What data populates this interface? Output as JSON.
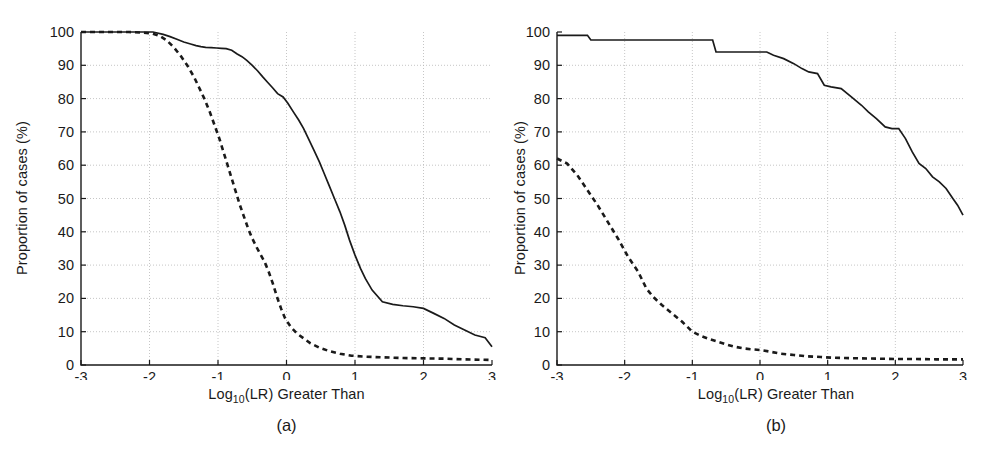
{
  "figure": {
    "background": "#ffffff",
    "ink_color": "#1a1a1a",
    "grid_color": "#b8b8b8"
  },
  "chart_data": [
    {
      "id": "panel-a",
      "type": "line",
      "title": "",
      "caption": "(a)",
      "xlabel": "Log10(LR) Greater Than",
      "xlabel_base": "Log",
      "xlabel_sub": "10",
      "xlabel_rest": "(LR) Greater Than",
      "ylabel": "Proportion of cases (%)",
      "xlim": [
        -3,
        3
      ],
      "ylim": [
        0,
        100
      ],
      "xticks": [
        -3,
        -2,
        -1,
        0,
        1,
        2,
        3
      ],
      "xtick_labels": [
        "-3",
        "-2",
        "-1",
        "0",
        "1",
        "2",
        "3"
      ],
      "yticks": [
        0,
        10,
        20,
        30,
        40,
        50,
        60,
        70,
        80,
        90,
        100
      ],
      "ytick_labels": [
        "0",
        "10",
        "20",
        "30",
        "40",
        "50",
        "60",
        "70",
        "80",
        "90",
        "100"
      ],
      "grid": true,
      "legend": "none",
      "series": [
        {
          "name": "solid-curve",
          "style": "solid",
          "x": [
            -3.0,
            -2.6,
            -2.2,
            -1.95,
            -1.8,
            -1.7,
            -1.6,
            -1.5,
            -1.4,
            -1.32,
            -1.25,
            -1.18,
            -1.1,
            -1.02,
            -0.95,
            -0.88,
            -0.8,
            -0.72,
            -0.65,
            -0.58,
            -0.5,
            -0.42,
            -0.35,
            -0.28,
            -0.2,
            -0.13,
            -0.05,
            0.02,
            0.1,
            0.18,
            0.25,
            0.32,
            0.4,
            0.48,
            0.55,
            0.62,
            0.7,
            0.78,
            0.85,
            0.92,
            1.0,
            1.08,
            1.15,
            1.25,
            1.4,
            1.55,
            1.7,
            1.85,
            2.0,
            2.15,
            2.3,
            2.45,
            2.6,
            2.75,
            2.9,
            3.0
          ],
          "y": [
            100.0,
            100.0,
            100.0,
            100.0,
            99.3,
            98.6,
            97.8,
            97.0,
            96.4,
            95.9,
            95.6,
            95.4,
            95.3,
            95.2,
            95.1,
            95.0,
            94.5,
            93.4,
            92.6,
            91.5,
            90.0,
            88.3,
            86.6,
            85.0,
            83.2,
            81.5,
            80.5,
            78.6,
            76.0,
            73.5,
            71.0,
            68.0,
            64.5,
            61.0,
            57.5,
            54.0,
            50.0,
            46.0,
            42.0,
            37.5,
            33.0,
            29.0,
            26.0,
            22.5,
            19.0,
            18.2,
            17.8,
            17.5,
            17.0,
            15.5,
            14.0,
            12.0,
            10.5,
            9.0,
            8.2,
            5.5
          ]
        },
        {
          "name": "dashed-curve",
          "style": "dashed",
          "x": [
            -3.0,
            -2.6,
            -2.3,
            -2.1,
            -1.95,
            -1.85,
            -1.75,
            -1.65,
            -1.55,
            -1.45,
            -1.35,
            -1.28,
            -1.2,
            -1.12,
            -1.05,
            -0.98,
            -0.92,
            -0.86,
            -0.8,
            -0.74,
            -0.68,
            -0.62,
            -0.56,
            -0.5,
            -0.44,
            -0.38,
            -0.32,
            -0.26,
            -0.2,
            -0.14,
            -0.08,
            -0.02,
            0.06,
            0.15,
            0.25,
            0.35,
            0.48,
            0.62,
            0.78,
            0.95,
            1.15,
            1.4,
            1.7,
            2.0,
            2.3,
            2.6,
            3.0
          ],
          "y": [
            100.0,
            100.0,
            100.0,
            99.8,
            99.5,
            98.8,
            97.5,
            95.5,
            93.0,
            90.0,
            86.5,
            83.5,
            80.0,
            76.0,
            72.0,
            68.0,
            64.0,
            60.0,
            56.0,
            52.0,
            48.0,
            44.5,
            41.0,
            38.0,
            35.5,
            33.2,
            31.0,
            28.0,
            24.5,
            20.5,
            17.0,
            14.0,
            11.5,
            9.5,
            8.0,
            6.5,
            5.2,
            4.2,
            3.4,
            2.8,
            2.5,
            2.3,
            2.1,
            2.0,
            1.9,
            1.7,
            1.5
          ]
        }
      ]
    },
    {
      "id": "panel-b",
      "type": "line",
      "title": "",
      "caption": "(b)",
      "xlabel": "Log10(LR) Greater Than",
      "xlabel_base": "Log",
      "xlabel_sub": "10",
      "xlabel_rest": "(LR) Greater Than",
      "ylabel": "Proportion of cases (%)",
      "xlim": [
        -3,
        3
      ],
      "ylim": [
        0,
        100
      ],
      "xticks": [
        -3,
        -2,
        -1,
        0,
        1,
        2,
        3
      ],
      "xtick_labels": [
        "-3",
        "-2",
        "-1",
        "0",
        "1",
        "2",
        "3"
      ],
      "yticks": [
        0,
        10,
        20,
        30,
        40,
        50,
        60,
        70,
        80,
        90,
        100
      ],
      "ytick_labels": [
        "0",
        "10",
        "20",
        "30",
        "40",
        "50",
        "60",
        "70",
        "80",
        "90",
        "100"
      ],
      "grid": true,
      "legend": "none",
      "series": [
        {
          "name": "solid-curve",
          "style": "solid",
          "x": [
            -3.0,
            -2.55,
            -2.5,
            -1.5,
            -0.7,
            -0.65,
            0.1,
            0.2,
            0.35,
            0.5,
            0.62,
            0.72,
            0.85,
            0.95,
            1.05,
            1.2,
            1.35,
            1.5,
            1.6,
            1.72,
            1.85,
            1.95,
            2.05,
            2.15,
            2.25,
            2.35,
            2.45,
            2.55,
            2.65,
            2.75,
            2.85,
            2.92,
            3.0
          ],
          "y": [
            99.0,
            99.0,
            97.6,
            97.6,
            97.6,
            94.0,
            94.0,
            93.0,
            92.0,
            90.5,
            89.0,
            88.0,
            87.5,
            84.0,
            83.5,
            83.0,
            80.5,
            78.0,
            76.0,
            74.0,
            71.5,
            71.0,
            71.0,
            68.0,
            64.0,
            60.5,
            59.0,
            56.5,
            55.0,
            53.0,
            50.0,
            48.0,
            45.0
          ]
        },
        {
          "name": "dashed-curve",
          "style": "dashed",
          "x": [
            -3.0,
            -2.85,
            -2.7,
            -2.55,
            -2.4,
            -2.25,
            -2.1,
            -1.95,
            -1.8,
            -1.68,
            -1.58,
            -1.45,
            -1.3,
            -1.15,
            -1.0,
            -0.88,
            -0.75,
            -0.62,
            -0.5,
            -0.38,
            -0.25,
            -0.12,
            0.0,
            0.15,
            0.3,
            0.5,
            0.7,
            0.9,
            1.05,
            1.25,
            1.5,
            1.75,
            2.0,
            2.3,
            2.6,
            3.0
          ],
          "y": [
            62.0,
            60.5,
            57.0,
            52.5,
            48.0,
            43.0,
            38.0,
            32.5,
            28.0,
            23.0,
            20.5,
            18.0,
            15.5,
            13.0,
            10.0,
            8.8,
            7.8,
            7.0,
            6.2,
            5.5,
            5.0,
            4.7,
            4.5,
            4.0,
            3.4,
            3.0,
            2.6,
            2.4,
            2.2,
            2.1,
            2.0,
            1.9,
            1.8,
            1.8,
            1.7,
            1.7
          ]
        }
      ]
    }
  ]
}
